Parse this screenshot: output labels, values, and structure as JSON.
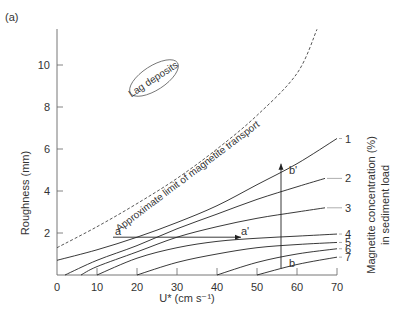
{
  "panel_label": "(a)",
  "chart_data": {
    "type": "line",
    "title": "",
    "panel_label": "(a)",
    "xlabel": "U* (cm s⁻¹)",
    "ylabel": "Roughness (mm)",
    "right_label_line1": "Magnetite concentration (%)",
    "right_label_line2": "in sediment load",
    "xlim": [
      0,
      70
    ],
    "ylim": [
      0,
      12
    ],
    "xticks": [
      0,
      10,
      20,
      30,
      40,
      50,
      60,
      70
    ],
    "yticks": [
      2,
      4,
      6,
      8,
      10
    ],
    "grid": false,
    "series": [
      {
        "name": "1",
        "x": [
          0,
          10,
          20,
          30,
          40,
          50,
          60,
          70
        ],
        "y": [
          0.7,
          1.2,
          1.8,
          2.5,
          3.3,
          4.3,
          5.3,
          6.5
        ]
      },
      {
        "name": "2",
        "x": [
          2,
          10,
          20,
          30,
          40,
          50,
          60,
          67
        ],
        "y": [
          0.0,
          0.7,
          1.4,
          2.2,
          2.9,
          3.6,
          4.2,
          4.6
        ]
      },
      {
        "name": "3",
        "x": [
          6,
          10,
          20,
          30,
          40,
          50,
          60,
          67
        ],
        "y": [
          0.0,
          0.4,
          1.1,
          1.8,
          2.3,
          2.7,
          3.0,
          3.2
        ]
      },
      {
        "name": "4",
        "x": [
          10,
          20,
          30,
          40,
          50,
          60,
          70
        ],
        "y": [
          0.0,
          0.8,
          1.3,
          1.6,
          1.75,
          1.85,
          1.95
        ]
      },
      {
        "name": "5",
        "x": [
          20,
          30,
          40,
          50,
          60,
          70
        ],
        "y": [
          0.0,
          0.6,
          1.0,
          1.3,
          1.45,
          1.55
        ]
      },
      {
        "name": "6",
        "x": [
          40,
          50,
          60,
          70
        ],
        "y": [
          0.0,
          0.6,
          1.0,
          1.25
        ]
      },
      {
        "name": "7",
        "x": [
          50,
          60,
          70
        ],
        "y": [
          0.0,
          0.5,
          0.85
        ]
      }
    ],
    "limit_line": {
      "name": "Approximate limit of magnetite transport",
      "style": "dashed",
      "x": [
        0,
        10,
        20,
        30,
        40,
        50,
        60,
        65
      ],
      "y": [
        1.3,
        2.3,
        3.4,
        4.6,
        6.0,
        7.6,
        9.6,
        11.7
      ]
    },
    "annotations": [
      {
        "text": "Lag deposits",
        "x": 20,
        "y": 7.6,
        "shape": "ellipse"
      },
      {
        "text": "a",
        "x": 14.5,
        "y": 1.9
      },
      {
        "text": "a'",
        "x": 46,
        "y": 1.9
      },
      {
        "text": "b",
        "x": 58,
        "y": 0.4
      },
      {
        "text": "b'",
        "x": 58,
        "y": 4.8
      }
    ],
    "arrows": [
      {
        "from": "a",
        "to": "a'",
        "x0": 14,
        "y0": 1.8,
        "x1": 46,
        "y1": 1.8
      },
      {
        "from": "b",
        "to": "b'",
        "x0": 56,
        "y0": 0.3,
        "x1": 56,
        "y1": 5.3
      }
    ]
  }
}
